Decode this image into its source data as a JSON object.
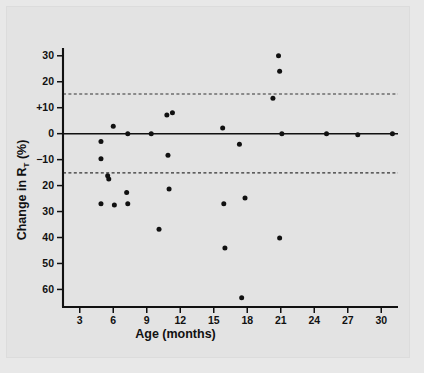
{
  "chart_data": {
    "type": "scatter",
    "title": "",
    "xlabel": "Age (months)",
    "ylabel": "Change in R_T (%)",
    "ylabel_parts": {
      "main_pre": "Change in R",
      "subscript": "T",
      "main_post": " (%)"
    },
    "xlim": [
      1.5,
      31.5
    ],
    "ylim": [
      -66,
      33
    ],
    "grid": false,
    "legend": null,
    "xticks": [
      3,
      6,
      9,
      12,
      15,
      18,
      21,
      24,
      27,
      30
    ],
    "xtick_labels": [
      "3",
      "6",
      "9",
      "12",
      "15",
      "18",
      "21",
      "24",
      "27",
      "30"
    ],
    "yticks": [
      30,
      20,
      10,
      0,
      -10,
      -20,
      -30,
      -40,
      -50,
      -60
    ],
    "ytick_labels": [
      "30",
      "20",
      "+10",
      "0",
      "−10",
      "20",
      "30",
      "40",
      "50",
      "60"
    ],
    "reference_lines": [
      {
        "name": "zero-line",
        "y": 0,
        "style": "solid",
        "label": ""
      },
      {
        "name": "upper-limit-of-agreement",
        "y": 15.3,
        "style": "dashed",
        "label": ""
      },
      {
        "name": "lower-limit-of-agreement",
        "y": -15.1,
        "style": "dashed",
        "label": ""
      }
    ],
    "points": [
      {
        "x": 4.9,
        "y": -3.0
      },
      {
        "x": 4.9,
        "y": -9.7
      },
      {
        "x": 4.9,
        "y": -27.0
      },
      {
        "x": 5.5,
        "y": -16.2
      },
      {
        "x": 5.6,
        "y": -17.5
      },
      {
        "x": 6.0,
        "y": 2.9
      },
      {
        "x": 6.1,
        "y": -27.5
      },
      {
        "x": 7.2,
        "y": -22.7
      },
      {
        "x": 7.3,
        "y": 0.0
      },
      {
        "x": 7.3,
        "y": -27.0
      },
      {
        "x": 9.4,
        "y": 0.0
      },
      {
        "x": 10.1,
        "y": -36.8
      },
      {
        "x": 10.8,
        "y": 7.2
      },
      {
        "x": 10.9,
        "y": -8.3
      },
      {
        "x": 11.0,
        "y": -21.3
      },
      {
        "x": 11.3,
        "y": 8.1
      },
      {
        "x": 15.8,
        "y": 2.2
      },
      {
        "x": 15.9,
        "y": -27.0
      },
      {
        "x": 16.0,
        "y": -44.0
      },
      {
        "x": 17.3,
        "y": -4.1
      },
      {
        "x": 17.5,
        "y": -63.2
      },
      {
        "x": 17.8,
        "y": -24.8
      },
      {
        "x": 20.3,
        "y": 13.6
      },
      {
        "x": 20.8,
        "y": 30.0
      },
      {
        "x": 20.9,
        "y": 24.0
      },
      {
        "x": 20.9,
        "y": -40.2
      },
      {
        "x": 21.1,
        "y": 0.0
      },
      {
        "x": 25.1,
        "y": 0.0
      },
      {
        "x": 27.9,
        "y": -0.4
      },
      {
        "x": 31.0,
        "y": 0.0
      }
    ],
    "point_count": 30,
    "marker": {
      "shape": "circle",
      "color": "#111111",
      "size_px": 4.6
    }
  },
  "colors": {
    "background": "#e8e8e8",
    "panel": "#e3e3e3",
    "ink": "#111111",
    "dashed": "#333333"
  }
}
